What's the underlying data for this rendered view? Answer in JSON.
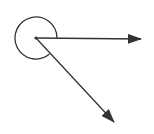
{
  "diagram": {
    "type": "reflex-angle",
    "colors": {
      "stroke": "#333333",
      "background": "#ffffff"
    },
    "vertex": {
      "x": 36,
      "y": 38
    },
    "arc": {
      "radius": 21
    },
    "rays": [
      {
        "name": "horizontal-ray",
        "end": {
          "x": 141,
          "y": 39
        }
      },
      {
        "name": "diagonal-ray",
        "end": {
          "x": 114,
          "y": 122
        }
      }
    ]
  }
}
